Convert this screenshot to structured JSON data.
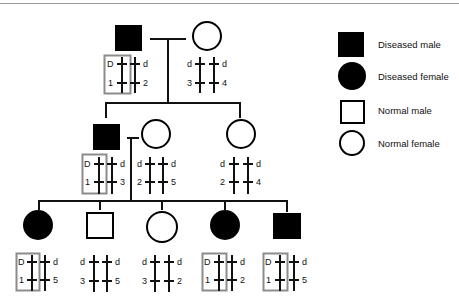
{
  "legend": [
    {
      "label": "Diseased male",
      "shape": "square",
      "filled": true
    },
    {
      "label": "Diseased female",
      "shape": "circle",
      "filled": true
    },
    {
      "label": "Normal male",
      "shape": "square",
      "filled": false
    },
    {
      "label": "Normal female",
      "shape": "circle",
      "filled": false
    }
  ],
  "generations": [
    {
      "individuals": [
        {
          "id": "I-1",
          "sex": "male",
          "affected": true,
          "highlight": true,
          "alleles": {
            "top_left": "D",
            "top_right": "d",
            "bottom_left": "1",
            "bottom_right": "2"
          }
        },
        {
          "id": "I-2",
          "sex": "female",
          "affected": false,
          "highlight": false,
          "alleles": {
            "top_left": "d",
            "top_right": "d",
            "bottom_left": "3",
            "bottom_right": "4"
          }
        }
      ]
    },
    {
      "individuals": [
        {
          "id": "II-1",
          "sex": "male",
          "affected": true,
          "highlight": true,
          "alleles": {
            "top_left": "D",
            "top_right": "d",
            "bottom_left": "1",
            "bottom_right": "3"
          }
        },
        {
          "id": "II-2",
          "sex": "female",
          "affected": false,
          "highlight": false,
          "alleles": {
            "top_left": "d",
            "top_right": "d",
            "bottom_left": "2",
            "bottom_right": "5"
          }
        },
        {
          "id": "II-3",
          "sex": "female",
          "affected": false,
          "highlight": false,
          "alleles": {
            "top_left": "d",
            "top_right": "d",
            "bottom_left": "2",
            "bottom_right": "4"
          }
        }
      ]
    },
    {
      "individuals": [
        {
          "id": "III-1",
          "sex": "female",
          "affected": true,
          "highlight": true,
          "alleles": {
            "top_left": "D",
            "top_right": "d",
            "bottom_left": "1",
            "bottom_right": "5"
          }
        },
        {
          "id": "III-2",
          "sex": "male",
          "affected": false,
          "highlight": false,
          "alleles": {
            "top_left": "d",
            "top_right": "d",
            "bottom_left": "3",
            "bottom_right": "5"
          }
        },
        {
          "id": "III-3",
          "sex": "female",
          "affected": false,
          "highlight": false,
          "alleles": {
            "top_left": "d",
            "top_right": "d",
            "bottom_left": "3",
            "bottom_right": "2"
          }
        },
        {
          "id": "III-4",
          "sex": "female",
          "affected": true,
          "highlight": true,
          "alleles": {
            "top_left": "D",
            "top_right": "d",
            "bottom_left": "1",
            "bottom_right": "2"
          }
        },
        {
          "id": "III-5",
          "sex": "male",
          "affected": true,
          "highlight": true,
          "alleles": {
            "top_left": "D",
            "top_right": "d",
            "bottom_left": "1",
            "bottom_right": "5"
          }
        }
      ]
    }
  ],
  "colors": {
    "symbol": "#000000",
    "highlight_box": "#8c8c8c",
    "line": "#111111"
  }
}
